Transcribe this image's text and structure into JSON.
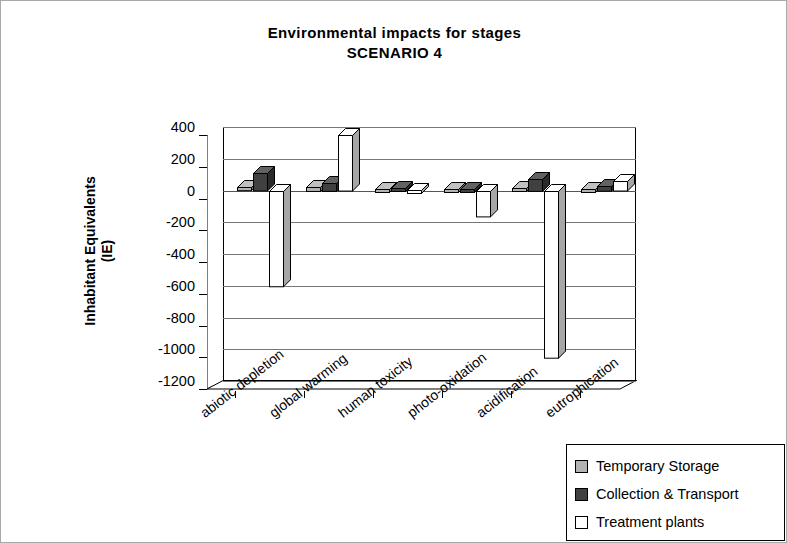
{
  "chart_data": {
    "type": "bar",
    "title": "Environmental impacts for stages",
    "subtitle": "SCENARIO 4",
    "xlabel": "",
    "ylabel": "Inhabitant Equivalents",
    "ylabel_line2": "(IE)",
    "ylim": [
      -1200,
      400
    ],
    "ytick_step": 200,
    "grid": true,
    "legend_position": "bottom-right",
    "style": "3d-clustered-column",
    "categories": [
      "abiotic depletion",
      "global warming",
      "human toxicity",
      "photo-oxidation",
      "acidification",
      "eutrophication"
    ],
    "ticks": [
      "400",
      "200",
      "0",
      "-200",
      "-400",
      "-600",
      "-800",
      "-1000",
      "-1200"
    ],
    "tick_values": [
      400,
      200,
      0,
      -200,
      -400,
      -600,
      -800,
      -1000,
      -1200
    ],
    "series": [
      {
        "name": "Temporary Storage",
        "color": "#b3b3b3",
        "values": [
          20,
          25,
          10,
          8,
          15,
          10
        ]
      },
      {
        "name": "Collection & Transport",
        "color": "#404040",
        "values": [
          110,
          50,
          15,
          12,
          75,
          30
        ]
      },
      {
        "name": "Treatment plants",
        "color": "#ffffff",
        "values": [
          -600,
          350,
          5,
          -160,
          -1050,
          60
        ]
      }
    ]
  },
  "legend": {
    "items": [
      {
        "label": "Temporary Storage",
        "color": "#b3b3b3"
      },
      {
        "label": "Collection & Transport",
        "color": "#404040"
      },
      {
        "label": "Treatment plants",
        "color": "#ffffff"
      }
    ]
  }
}
